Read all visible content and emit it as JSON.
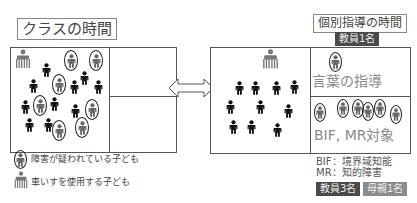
{
  "left": {
    "title": "クラスの時間"
  },
  "right": {
    "title": "個別指導の時間",
    "teacher_badge_top": "教員1名",
    "top_box_label": "言葉の指導",
    "bottom_box_label": "BIF, MR対象",
    "definitions": [
      "BIF：境界域知能",
      "MR：知的障害"
    ],
    "badges_bottom": [
      {
        "label": "教員3名",
        "style": "dark"
      },
      {
        "label": "母親1名",
        "style": "mid"
      }
    ]
  },
  "legend": [
    {
      "icon": "circled-child-icon",
      "label": "障害が疑われている子ども"
    },
    {
      "icon": "wheelchair-child-icon",
      "label": "車いすを使用する子ども"
    }
  ],
  "arrow": {
    "icon": "double-arrow-icon"
  },
  "colors": {
    "dark_badge": "#4a4a4a",
    "mid_badge": "#8a8a8a",
    "child_black": "#111111",
    "child_gray": "#666666",
    "border": "#555555"
  }
}
